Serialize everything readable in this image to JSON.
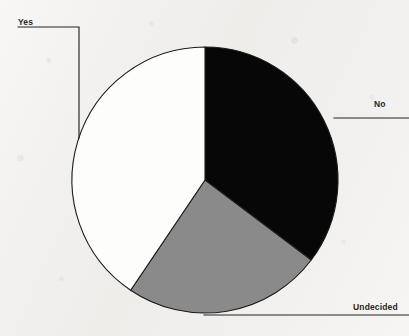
{
  "figure": {
    "name": "pie-chart-figure",
    "background_color": "#f1efed",
    "outline_color": "#1b1a19",
    "leader_line_color": "#262422"
  },
  "chart_data": {
    "type": "pie",
    "title": "",
    "subtitle": "",
    "xlabel": "",
    "ylabel": "",
    "grid": false,
    "legend_position": "none",
    "label_style": "external-with-leader-lines",
    "start_angle_deg": 0,
    "direction": "clockwise",
    "center": {
      "x": 205,
      "y": 180
    },
    "radius": 133,
    "categories": [
      "No",
      "Undecided",
      "Yes"
    ],
    "values": [
      35,
      24,
      41
    ],
    "value_unit": "percent",
    "slices": [
      {
        "label": "No",
        "value": 35,
        "color": "#070707",
        "color_name": "black",
        "start_angle_deg": 0,
        "end_angle_deg": 127,
        "sweep_deg": 127,
        "label_position": {
          "x": 374,
          "y": 99
        },
        "leader_line": {
          "kind": "horizontal",
          "from": {
            "x": 334,
            "y": 118
          },
          "to": {
            "x": 409,
            "y": 118
          }
        }
      },
      {
        "label": "Undecided",
        "value": 24,
        "color": "#8a8a8a",
        "color_name": "gray",
        "start_angle_deg": 127,
        "end_angle_deg": 214,
        "sweep_deg": 87,
        "label_position": {
          "x": 353,
          "y": 302
        },
        "leader_line": {
          "kind": "horizontal",
          "from": {
            "x": 204,
            "y": 315
          },
          "to": {
            "x": 409,
            "y": 315
          }
        }
      },
      {
        "label": "Yes",
        "value": 41,
        "color": "#fdfdfc",
        "color_name": "white",
        "start_angle_deg": 214,
        "end_angle_deg": 360,
        "sweep_deg": 146,
        "label_position": {
          "x": 18,
          "y": 17
        },
        "leader_line": {
          "kind": "elbow",
          "from": {
            "x": 18,
            "y": 27
          },
          "corner": {
            "x": 79,
            "y": 27
          },
          "to": {
            "x": 79,
            "y": 138
          }
        }
      }
    ]
  },
  "labels": {
    "yes": "Yes",
    "no": "No",
    "undecided": "Undecided"
  }
}
